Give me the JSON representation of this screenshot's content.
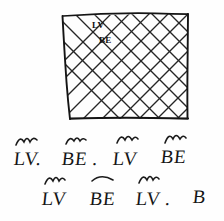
{
  "canvas": {
    "width": 224,
    "height": 221,
    "background_color": "#fefefe",
    "ink_color": "#151515"
  },
  "sketch": {
    "type": "hand-drawn-diagram",
    "description": "Hand drawn crosshatched rectangle with handwritten LV and BE annotations",
    "rectangle": {
      "name": "crosshatched-region",
      "fill_pattern": "diagonal-crosshatch",
      "corners": {
        "top_left_x": 62,
        "top_left_y": 16,
        "top_right_x": 188,
        "top_right_y": 13,
        "bottom_right_x": 188,
        "bottom_right_y": 118,
        "bottom_left_x": 70,
        "bottom_left_y": 119
      },
      "hatch_spacing": 19,
      "labels": [
        {
          "text": "LV",
          "x": 92,
          "y": 28
        },
        {
          "text": "BE",
          "x": 99,
          "y": 43
        }
      ]
    }
  },
  "annotations": {
    "row1": [
      {
        "text": "LV.",
        "mark": "tilde",
        "x": 14,
        "y": 148
      },
      {
        "text": "BE .",
        "mark": "tilde",
        "x": 62,
        "y": 148
      },
      {
        "text": "LV",
        "mark": "tilde",
        "x": 113,
        "y": 148
      },
      {
        "text": "BE",
        "mark": "tilde",
        "x": 161,
        "y": 146
      }
    ],
    "row2": [
      {
        "text": "LV",
        "mark": "tilde",
        "x": 42,
        "y": 188
      },
      {
        "text": "BE",
        "mark": "arc",
        "x": 90,
        "y": 188
      },
      {
        "text": "LV .",
        "mark": "tilde",
        "x": 136,
        "y": 188
      },
      {
        "text": "B",
        "mark": "none",
        "x": 193,
        "y": 186
      }
    ]
  }
}
